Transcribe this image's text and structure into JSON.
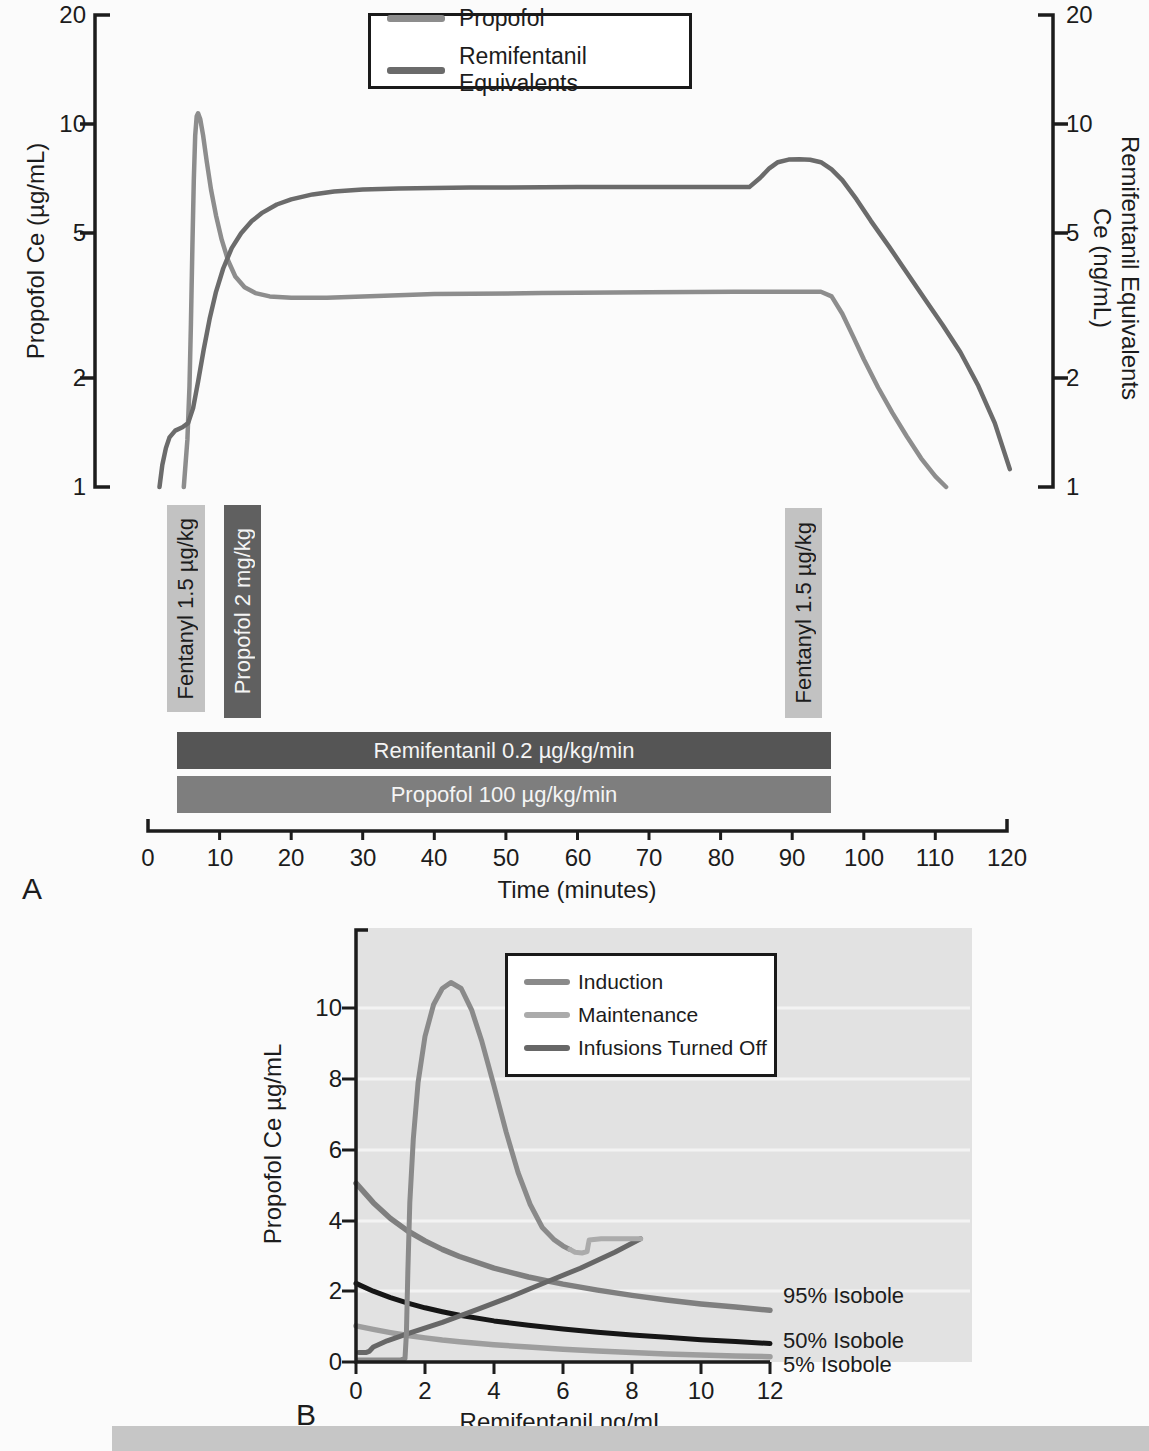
{
  "figure": {
    "panel_a_letter": "A",
    "panel_b_letter": "B"
  },
  "chart_data": [
    {
      "type": "line",
      "panel": "A",
      "x": {
        "label": "Time (minutes)",
        "ticks": [
          "0",
          "10",
          "20",
          "30",
          "40",
          "50",
          "60",
          "70",
          "80",
          "90",
          "100",
          "110",
          "120"
        ],
        "range": [
          0,
          120
        ],
        "grid": false
      },
      "y_left": {
        "label": "Propofol Ce (µg/mL)",
        "scale": "log",
        "ticks": [
          "20",
          "10",
          "5",
          "2",
          "1"
        ],
        "range": [
          1,
          20
        ]
      },
      "y_right": {
        "label_line1": "Remifentanil Equivalents",
        "label_line2": "Ce (ng/mL)",
        "scale": "log",
        "ticks": [
          "20",
          "10",
          "5",
          "2",
          "1"
        ],
        "range": [
          1,
          20
        ]
      },
      "legend": {
        "position": "top-center",
        "entries": [
          {
            "label": "Propofol",
            "color": "#8d8d8d"
          },
          {
            "label": "Remifentanil Equivalents",
            "color": "#6b6b6b"
          }
        ]
      },
      "series": [
        {
          "name": "Propofol",
          "axis": "left",
          "color": "#8d8d8d",
          "points": [
            [
              5.0,
              1.0
            ],
            [
              5.5,
              1.35
            ],
            [
              5.8,
              1.9
            ],
            [
              6.0,
              2.8
            ],
            [
              6.2,
              4.6
            ],
            [
              6.4,
              7.0
            ],
            [
              6.6,
              9.3
            ],
            [
              6.8,
              10.5
            ],
            [
              7.0,
              10.7
            ],
            [
              7.3,
              10.3
            ],
            [
              7.7,
              9.3
            ],
            [
              8.2,
              7.9
            ],
            [
              8.8,
              6.6
            ],
            [
              9.5,
              5.6
            ],
            [
              10.3,
              4.8
            ],
            [
              11.2,
              4.2
            ],
            [
              12.2,
              3.8
            ],
            [
              13.5,
              3.55
            ],
            [
              15,
              3.42
            ],
            [
              17,
              3.35
            ],
            [
              20,
              3.32
            ],
            [
              25,
              3.32
            ],
            [
              30,
              3.35
            ],
            [
              40,
              3.4
            ],
            [
              55,
              3.42
            ],
            [
              70,
              3.44
            ],
            [
              82,
              3.45
            ],
            [
              90,
              3.45
            ],
            [
              94,
              3.45
            ],
            [
              95.5,
              3.35
            ],
            [
              97,
              3.0
            ],
            [
              98.5,
              2.6
            ],
            [
              100,
              2.25
            ],
            [
              102,
              1.88
            ],
            [
              104,
              1.6
            ],
            [
              106,
              1.38
            ],
            [
              108,
              1.2
            ],
            [
              110,
              1.07
            ],
            [
              111.5,
              1.0
            ]
          ]
        },
        {
          "name": "Remifentanil Equivalents",
          "axis": "right",
          "color": "#6b6b6b",
          "points": [
            [
              1.6,
              1.0
            ],
            [
              2.0,
              1.15
            ],
            [
              2.5,
              1.28
            ],
            [
              3.0,
              1.37
            ],
            [
              3.8,
              1.43
            ],
            [
              4.8,
              1.46
            ],
            [
              5.6,
              1.5
            ],
            [
              6.3,
              1.65
            ],
            [
              7.0,
              1.95
            ],
            [
              7.8,
              2.4
            ],
            [
              8.6,
              2.9
            ],
            [
              9.5,
              3.45
            ],
            [
              10.5,
              4.0
            ],
            [
              11.7,
              4.55
            ],
            [
              13,
              5.0
            ],
            [
              14.5,
              5.4
            ],
            [
              16,
              5.7
            ],
            [
              18,
              6.0
            ],
            [
              20,
              6.2
            ],
            [
              23,
              6.4
            ],
            [
              26,
              6.52
            ],
            [
              30,
              6.6
            ],
            [
              35,
              6.64
            ],
            [
              45,
              6.68
            ],
            [
              60,
              6.7
            ],
            [
              75,
              6.7
            ],
            [
              84,
              6.7
            ],
            [
              85.5,
              7.1
            ],
            [
              86.8,
              7.55
            ],
            [
              88,
              7.85
            ],
            [
              89.5,
              7.98
            ],
            [
              91,
              8.0
            ],
            [
              92.5,
              7.97
            ],
            [
              94,
              7.85
            ],
            [
              95.5,
              7.5
            ],
            [
              97,
              7.0
            ],
            [
              99,
              6.2
            ],
            [
              101,
              5.4
            ],
            [
              103.5,
              4.6
            ],
            [
              106,
              3.9
            ],
            [
              108.5,
              3.3
            ],
            [
              111,
              2.8
            ],
            [
              113.5,
              2.35
            ],
            [
              116,
              1.9
            ],
            [
              118.3,
              1.5
            ],
            [
              120.4,
              1.12
            ]
          ]
        }
      ],
      "interventions": [
        {
          "label": "Fentanyl 1.5 µg/kg",
          "type": "bolus"
        },
        {
          "label": "Propofol 2 mg/kg",
          "type": "bolus"
        },
        {
          "label": "Fentanyl 1.5 µg/kg",
          "type": "bolus"
        },
        {
          "label": "Remifentanil 0.2 µg/kg/min",
          "type": "infusion"
        },
        {
          "label": "Propofol 100 µg/kg/min",
          "type": "infusion"
        }
      ]
    },
    {
      "type": "line",
      "panel": "B",
      "x": {
        "label": "Remifentanil ng/mL",
        "ticks": [
          "0",
          "2",
          "4",
          "6",
          "8",
          "10",
          "12"
        ],
        "range": [
          0,
          12
        ],
        "grid": false
      },
      "y": {
        "label": "Propofol Ce µg/mL",
        "ticks": [
          "10",
          "8",
          "6",
          "4",
          "2",
          "0"
        ],
        "range": [
          0,
          12
        ],
        "grid": "horizontal-white"
      },
      "plot_background": "#e2e2e2",
      "legend": {
        "position": "top-center",
        "entries": [
          {
            "label": "Induction",
            "color": "#8a8a8a"
          },
          {
            "label": "Maintenance",
            "color": "#ababab"
          },
          {
            "label": "Infusions Turned Off",
            "color": "#676767"
          }
        ]
      },
      "series": [
        {
          "name": "Induction",
          "color": "#8a8a8a",
          "points": [
            [
              0.05,
              0.06
            ],
            [
              1.3,
              0.06
            ],
            [
              1.42,
              0.1
            ],
            [
              1.46,
              0.8
            ],
            [
              1.5,
              2.5
            ],
            [
              1.56,
              4.5
            ],
            [
              1.66,
              6.3
            ],
            [
              1.8,
              7.9
            ],
            [
              2.0,
              9.2
            ],
            [
              2.25,
              10.1
            ],
            [
              2.5,
              10.55
            ],
            [
              2.75,
              10.72
            ],
            [
              3.05,
              10.55
            ],
            [
              3.35,
              9.95
            ],
            [
              3.65,
              9.05
            ],
            [
              4.0,
              7.8
            ],
            [
              4.35,
              6.5
            ],
            [
              4.7,
              5.35
            ],
            [
              5.05,
              4.45
            ],
            [
              5.4,
              3.8
            ],
            [
              5.75,
              3.45
            ],
            [
              6.0,
              3.28
            ],
            [
              6.2,
              3.18
            ]
          ]
        },
        {
          "name": "Maintenance",
          "color": "#ababab",
          "points": [
            [
              6.2,
              3.18
            ],
            [
              6.35,
              3.1
            ],
            [
              6.55,
              3.08
            ],
            [
              6.7,
              3.12
            ],
            [
              6.73,
              3.3
            ],
            [
              6.76,
              3.45
            ],
            [
              7.1,
              3.48
            ],
            [
              7.7,
              3.48
            ],
            [
              8.25,
              3.48
            ]
          ]
        },
        {
          "name": "Infusions Turned Off",
          "color": "#676767",
          "points": [
            [
              8.25,
              3.48
            ],
            [
              7.5,
              3.1
            ],
            [
              6.5,
              2.65
            ],
            [
              5.5,
              2.25
            ],
            [
              4.5,
              1.85
            ],
            [
              3.5,
              1.48
            ],
            [
              2.5,
              1.12
            ],
            [
              1.5,
              0.8
            ],
            [
              0.9,
              0.6
            ],
            [
              0.5,
              0.42
            ],
            [
              0.38,
              0.3
            ],
            [
              0.3,
              0.27
            ],
            [
              0.08,
              0.27
            ]
          ]
        },
        {
          "name": "95% Isobole",
          "color": "#7f7f7f",
          "points": [
            [
              0,
              5.05
            ],
            [
              0.5,
              4.5
            ],
            [
              1,
              4.05
            ],
            [
              1.5,
              3.7
            ],
            [
              2,
              3.42
            ],
            [
              2.5,
              3.18
            ],
            [
              3,
              2.98
            ],
            [
              4,
              2.65
            ],
            [
              5,
              2.4
            ],
            [
              6,
              2.2
            ],
            [
              7,
              2.03
            ],
            [
              8,
              1.88
            ],
            [
              9,
              1.75
            ],
            [
              10,
              1.64
            ],
            [
              11,
              1.55
            ],
            [
              12,
              1.46
            ]
          ]
        },
        {
          "name": "50% Isobole",
          "color": "#161616",
          "points": [
            [
              0,
              2.22
            ],
            [
              0.5,
              2.0
            ],
            [
              1,
              1.82
            ],
            [
              1.5,
              1.66
            ],
            [
              2,
              1.53
            ],
            [
              2.5,
              1.42
            ],
            [
              3,
              1.32
            ],
            [
              4,
              1.16
            ],
            [
              5,
              1.04
            ],
            [
              6,
              0.93
            ],
            [
              7,
              0.84
            ],
            [
              8,
              0.76
            ],
            [
              9,
              0.7
            ],
            [
              10,
              0.63
            ],
            [
              11,
              0.58
            ],
            [
              12,
              0.52
            ]
          ]
        },
        {
          "name": "5% Isobole",
          "color": "#9e9e9e",
          "points": [
            [
              0,
              1.02
            ],
            [
              0.5,
              0.92
            ],
            [
              1,
              0.83
            ],
            [
              1.5,
              0.75
            ],
            [
              2,
              0.68
            ],
            [
              2.5,
              0.62
            ],
            [
              3,
              0.57
            ],
            [
              4,
              0.49
            ],
            [
              5,
              0.42
            ],
            [
              6,
              0.36
            ],
            [
              7,
              0.31
            ],
            [
              8,
              0.27
            ],
            [
              9,
              0.23
            ],
            [
              10,
              0.2
            ],
            [
              11,
              0.17
            ],
            [
              12,
              0.15
            ]
          ]
        }
      ],
      "annotations": [
        {
          "label": "95% Isobole"
        },
        {
          "label": "50% Isobole"
        },
        {
          "label": "5% Isobole"
        }
      ]
    }
  ]
}
